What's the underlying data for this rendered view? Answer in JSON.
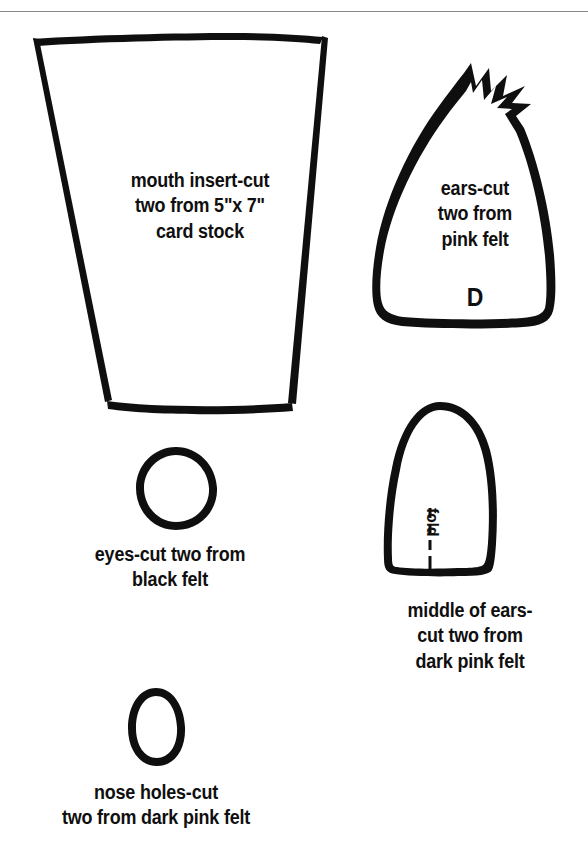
{
  "page": {
    "background_color": "#ffffff",
    "ink_color": "#100f0f",
    "rule_color": "#8a8a8a"
  },
  "pieces": [
    {
      "id": "mouth-insert",
      "shape": "tapered-trapezoid",
      "caption": "mouth insert-cut\ntwo from 5\"x 7\"\ncard stock"
    },
    {
      "id": "ears",
      "shape": "dome-with-spiky-crown",
      "caption": "ears-cut\ntwo from\npink felt",
      "letter": "D"
    },
    {
      "id": "eyes",
      "shape": "oval",
      "caption": "eyes-cut two from\nblack felt"
    },
    {
      "id": "middle-of-ears",
      "shape": "rounded-dome",
      "caption": "middle of ears-\ncut two from\ndark pink felt",
      "fold_label": "fold"
    },
    {
      "id": "nose-holes",
      "shape": "egg",
      "caption": "nose holes-cut\ntwo from dark pink felt"
    }
  ]
}
